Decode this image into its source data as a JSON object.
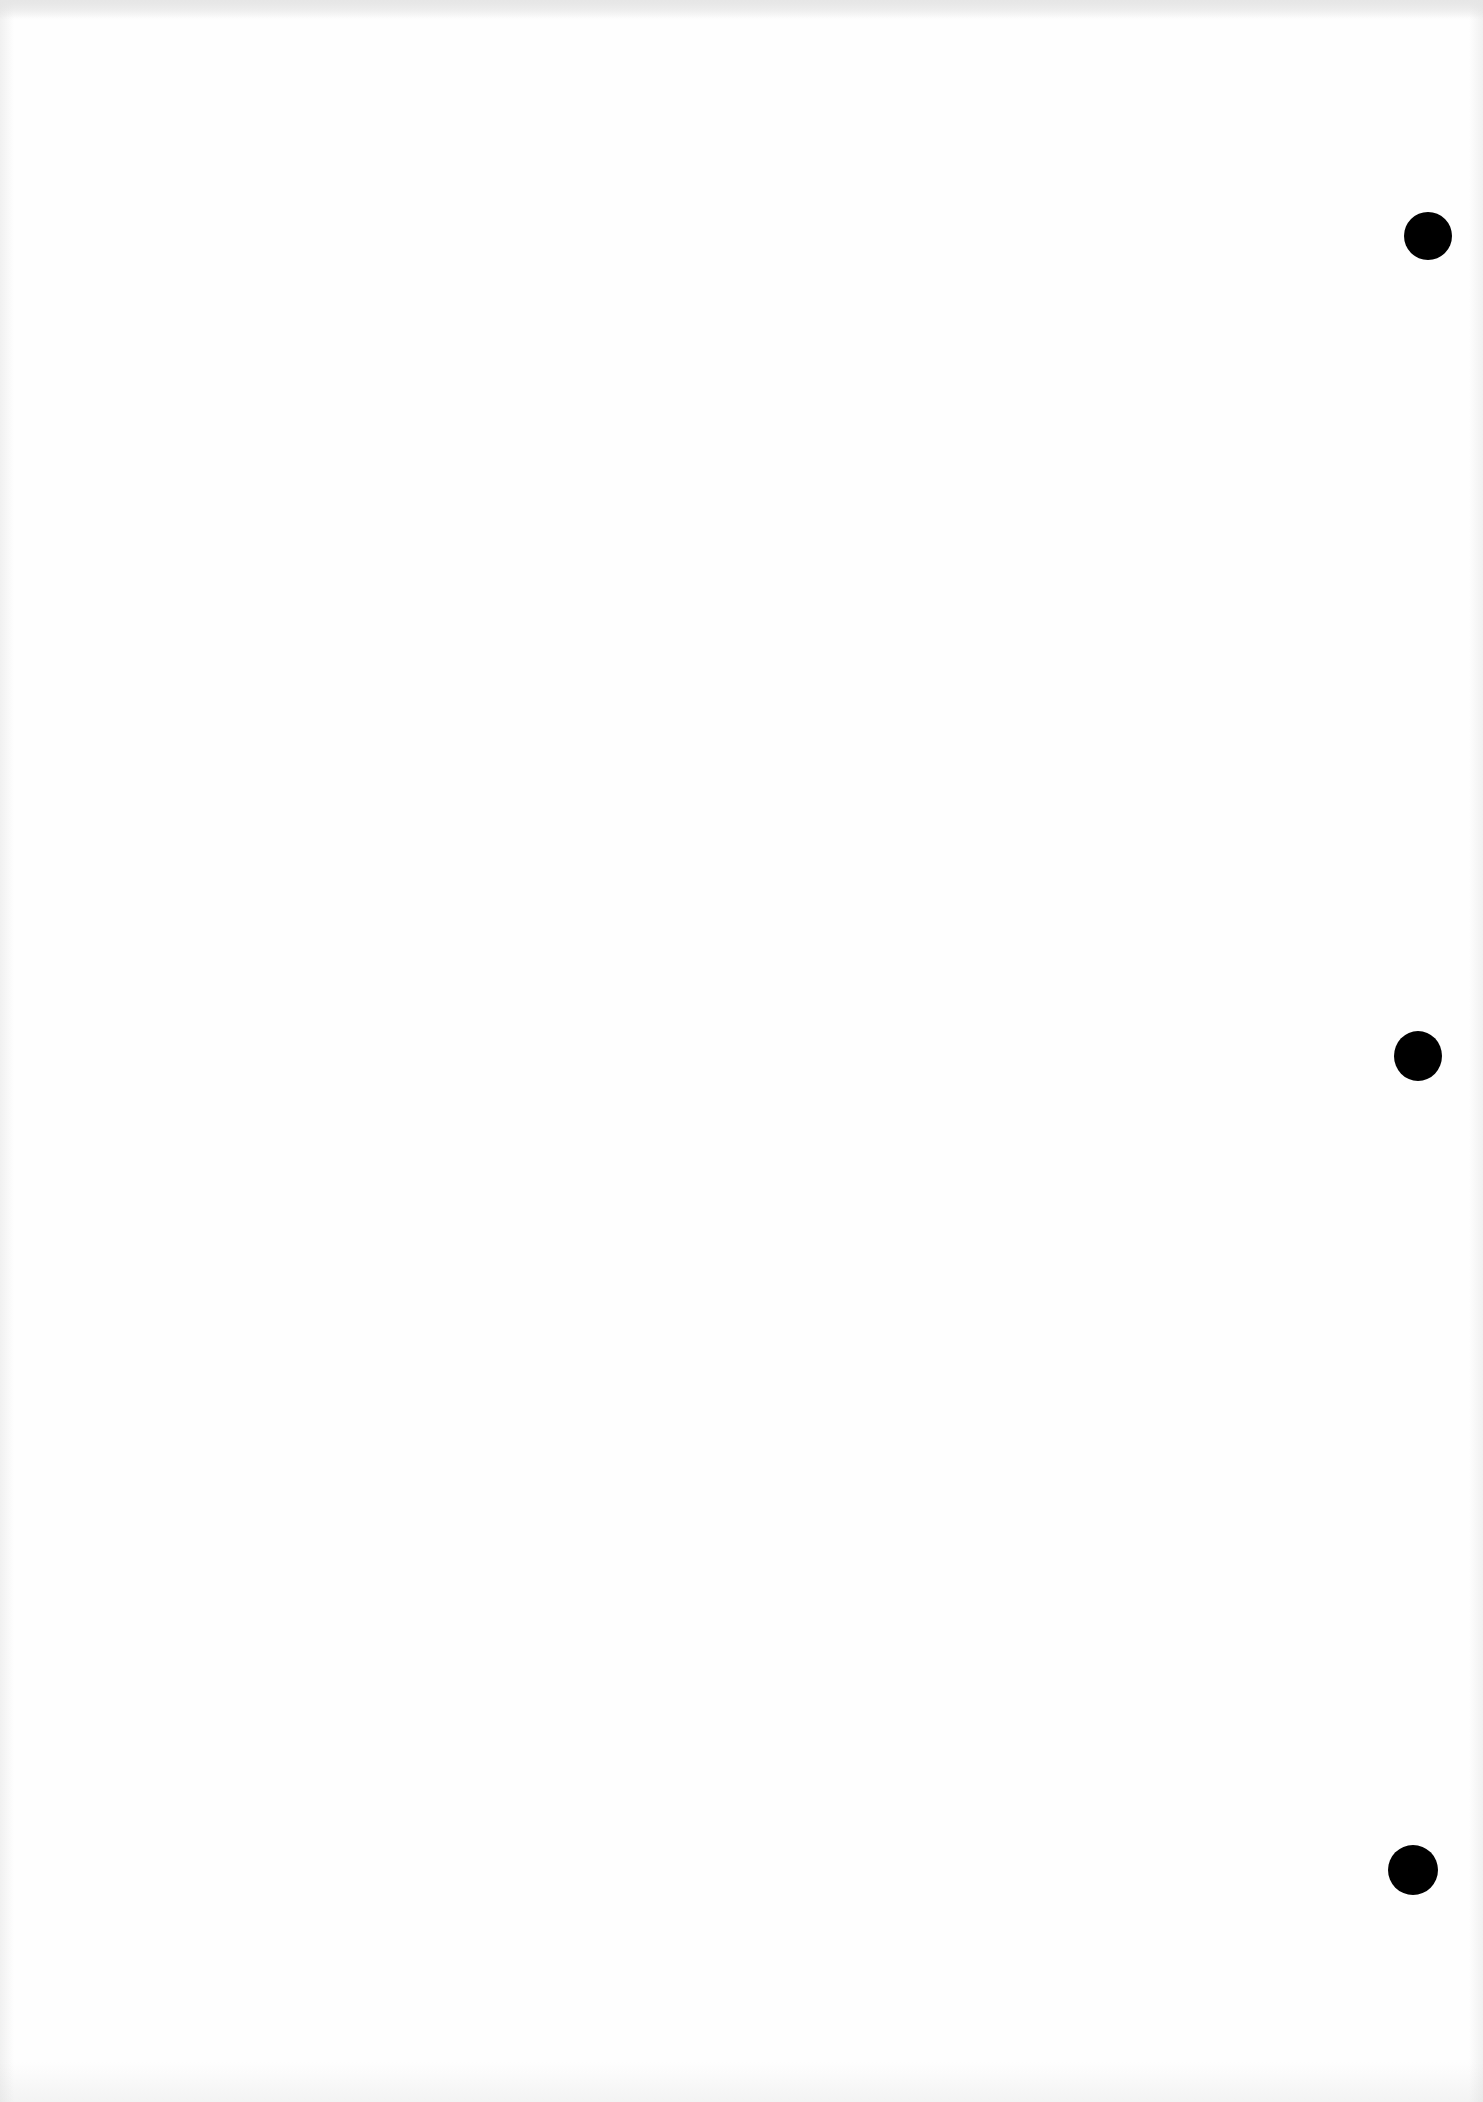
{
  "document": {
    "type": "blank scanned page",
    "text": "",
    "background_color": "#fefefe",
    "punch_holes": [
      {
        "cx": 1428,
        "cy": 236,
        "r": 24,
        "color": "#000000"
      },
      {
        "cx": 1418,
        "cy": 1055,
        "r": 24,
        "color": "#000000"
      },
      {
        "cx": 1413,
        "cy": 1870,
        "r": 25,
        "color": "#000000"
      }
    ]
  }
}
